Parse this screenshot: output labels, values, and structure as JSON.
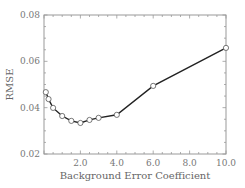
{
  "chart_data": {
    "type": "line",
    "title": "",
    "xlabel": "Background Error Coefficient",
    "ylabel": "RMSE",
    "xlim": [
      0,
      10
    ],
    "ylim": [
      0.02,
      0.08
    ],
    "x_ticks": [
      "2.0",
      "4.0",
      "6.0",
      "8.0",
      "10.0"
    ],
    "y_ticks": [
      "0.02",
      "0.04",
      "0.06",
      "0.08"
    ],
    "grid": false,
    "legend": null,
    "series": [
      {
        "name": "RMSE",
        "x": [
          0.1,
          0.25,
          0.5,
          1.0,
          1.5,
          2.0,
          2.5,
          3.0,
          4.0,
          6.0,
          10.0
        ],
        "y": [
          0.0467,
          0.0437,
          0.0399,
          0.0364,
          0.0343,
          0.0334,
          0.0347,
          0.0356,
          0.0369,
          0.0494,
          0.0658
        ],
        "marker": "open-circle",
        "color": "#222222"
      }
    ]
  }
}
